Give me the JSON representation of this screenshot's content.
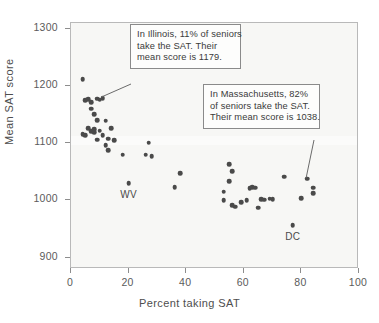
{
  "chart_data": {
    "type": "scatter",
    "title": "",
    "xlabel": "Percent taking SAT",
    "ylabel": "Mean SAT score",
    "xlim": [
      0,
      100
    ],
    "ylim": [
      880,
      1310
    ],
    "xticks": [
      0,
      20,
      40,
      60,
      80,
      100
    ],
    "yticks": [
      900,
      1000,
      1100,
      1200,
      1300
    ],
    "xtick_labels": [
      "0",
      "20",
      "40",
      "60",
      "80",
      "100"
    ],
    "ytick_labels": [
      "900",
      "1000",
      "1100",
      "1200",
      "1300"
    ],
    "grid": false,
    "legend": null,
    "marker_color": "#4a4a4a",
    "points": [
      {
        "x": 4,
        "y": 1212
      },
      {
        "x": 4,
        "y": 1116
      },
      {
        "x": 5,
        "y": 1175
      },
      {
        "x": 5,
        "y": 1114
      },
      {
        "x": 6,
        "y": 1177
      },
      {
        "x": 6,
        "y": 1126
      },
      {
        "x": 7,
        "y": 1172
      },
      {
        "x": 7,
        "y": 1160
      },
      {
        "x": 7,
        "y": 1121
      },
      {
        "x": 8,
        "y": 1151
      },
      {
        "x": 8,
        "y": 1124
      },
      {
        "x": 8,
        "y": 1119
      },
      {
        "x": 9,
        "y": 1178
      },
      {
        "x": 9,
        "y": 1140
      },
      {
        "x": 9,
        "y": 1106
      },
      {
        "x": 10,
        "y": 1176
      },
      {
        "x": 10,
        "y": 1122
      },
      {
        "x": 11,
        "y": 1179
      },
      {
        "x": 11,
        "y": 1114
      },
      {
        "x": 12,
        "y": 1139
      },
      {
        "x": 12,
        "y": 1096
      },
      {
        "x": 13,
        "y": 1108
      },
      {
        "x": 13,
        "y": 1088
      },
      {
        "x": 14,
        "y": 1126
      },
      {
        "x": 15,
        "y": 1105
      },
      {
        "x": 18,
        "y": 1080
      },
      {
        "x": 20,
        "y": 1030
      },
      {
        "x": 26,
        "y": 1080
      },
      {
        "x": 27,
        "y": 1101
      },
      {
        "x": 28,
        "y": 1077
      },
      {
        "x": 36,
        "y": 1023
      },
      {
        "x": 38,
        "y": 1047
      },
      {
        "x": 53,
        "y": 1015
      },
      {
        "x": 53,
        "y": 1000
      },
      {
        "x": 55,
        "y": 1033
      },
      {
        "x": 55,
        "y": 1063
      },
      {
        "x": 56,
        "y": 1051
      },
      {
        "x": 56,
        "y": 991
      },
      {
        "x": 57,
        "y": 989
      },
      {
        "x": 59,
        "y": 997
      },
      {
        "x": 61,
        "y": 1000
      },
      {
        "x": 62,
        "y": 1021
      },
      {
        "x": 63,
        "y": 1023
      },
      {
        "x": 64,
        "y": 1022
      },
      {
        "x": 65,
        "y": 987
      },
      {
        "x": 66,
        "y": 1002
      },
      {
        "x": 67,
        "y": 1001
      },
      {
        "x": 69,
        "y": 1003
      },
      {
        "x": 70,
        "y": 1002
      },
      {
        "x": 74,
        "y": 1041
      },
      {
        "x": 77,
        "y": 957
      },
      {
        "x": 80,
        "y": 1004
      },
      {
        "x": 82,
        "y": 1038
      },
      {
        "x": 84,
        "y": 1022
      },
      {
        "x": 84,
        "y": 1013
      }
    ],
    "point_labels": [
      {
        "text": "WV",
        "x": 20,
        "y": 1030
      },
      {
        "text": "DC",
        "x": 77,
        "y": 957
      }
    ],
    "annotations": [
      {
        "id": "illinois",
        "lines": [
          "In Illinois, 11% of seniors",
          "take the SAT. Their",
          "mean score is 1179."
        ],
        "target_x": 11,
        "target_y": 1179
      },
      {
        "id": "massachusetts",
        "lines": [
          "In Massachusetts, 82%",
          "of seniors take the SAT.",
          "Their mean score is 1038."
        ],
        "target_x": 82,
        "target_y": 1038
      }
    ]
  }
}
